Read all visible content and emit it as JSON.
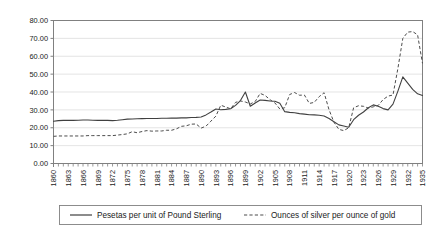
{
  "chart_data": {
    "type": "line",
    "title": "",
    "subtitle": "",
    "xlabel": "",
    "ylabel": "",
    "xlim": [
      1860,
      1935
    ],
    "ylim": [
      0,
      80
    ],
    "grid": true,
    "legend_position": "bottom",
    "y_ticks": [
      "0.00",
      "10.00",
      "20.00",
      "30.00",
      "40.00",
      "50.00",
      "60.00",
      "70.00",
      "80.00"
    ],
    "y_tick_values": [
      0,
      10,
      20,
      30,
      40,
      50,
      60,
      70,
      80
    ],
    "x_tick_labels": [
      "1860",
      "1863",
      "1866",
      "1869",
      "1872",
      "1875",
      "1878",
      "1881",
      "1884",
      "1887",
      "1890",
      "1893",
      "1896",
      "1899",
      "1902",
      "1905",
      "1908",
      "1911",
      "1914",
      "1917",
      "1920",
      "1923",
      "1926",
      "1929",
      "1932",
      "1935"
    ],
    "x_tick_values": [
      1860,
      1863,
      1866,
      1869,
      1872,
      1875,
      1878,
      1881,
      1884,
      1887,
      1890,
      1893,
      1896,
      1899,
      1902,
      1905,
      1908,
      1911,
      1914,
      1917,
      1920,
      1923,
      1926,
      1929,
      1932,
      1935
    ],
    "x": [
      1860,
      1861,
      1862,
      1863,
      1864,
      1865,
      1866,
      1867,
      1868,
      1869,
      1870,
      1871,
      1872,
      1873,
      1874,
      1875,
      1876,
      1877,
      1878,
      1879,
      1880,
      1881,
      1882,
      1883,
      1884,
      1885,
      1886,
      1887,
      1888,
      1889,
      1890,
      1891,
      1892,
      1893,
      1894,
      1895,
      1896,
      1897,
      1898,
      1899,
      1900,
      1901,
      1902,
      1903,
      1904,
      1905,
      1906,
      1907,
      1908,
      1909,
      1910,
      1911,
      1912,
      1913,
      1914,
      1915,
      1916,
      1917,
      1918,
      1919,
      1920,
      1921,
      1922,
      1923,
      1924,
      1925,
      1926,
      1927,
      1928,
      1929,
      1930,
      1931,
      1932,
      1933,
      1934,
      1935
    ],
    "series": [
      {
        "name": "Pesetas per unit of Pound Sterling",
        "style": "solid",
        "color": "#404040",
        "values": [
          23.6,
          24.0,
          24.1,
          24.1,
          24.1,
          24.2,
          24.3,
          24.3,
          24.2,
          24.1,
          24.2,
          24.1,
          24.0,
          24.2,
          24.5,
          24.8,
          24.9,
          25.0,
          25.1,
          25.2,
          25.2,
          25.2,
          25.3,
          25.3,
          25.4,
          25.4,
          25.5,
          25.5,
          25.7,
          25.8,
          26.0,
          27.2,
          28.8,
          30.5,
          30.1,
          30.3,
          30.6,
          32.5,
          35.2,
          40.0,
          32.0,
          33.8,
          35.5,
          35.3,
          35.0,
          34.8,
          33.7,
          29.0,
          28.6,
          28.4,
          27.9,
          27.6,
          27.3,
          27.2,
          27.0,
          26.6,
          25.2,
          23.4,
          21.6,
          21.0,
          20.3,
          24.5,
          27.0,
          28.8,
          31.2,
          32.8,
          32.0,
          30.7,
          30.0,
          33.2,
          40.5,
          48.5,
          45.0,
          41.5,
          39.0,
          38.0
        ]
      },
      {
        "name": "Ounces of silver per ounce of gold",
        "style": "dashed",
        "color": "#4d4d4d",
        "values": [
          15.2,
          15.4,
          15.4,
          15.4,
          15.4,
          15.4,
          15.4,
          15.6,
          15.6,
          15.6,
          15.6,
          15.6,
          15.6,
          15.9,
          16.2,
          16.6,
          17.8,
          17.2,
          17.9,
          18.4,
          18.1,
          18.2,
          18.2,
          18.6,
          18.6,
          19.4,
          20.8,
          21.1,
          22.0,
          22.1,
          19.8,
          20.9,
          23.7,
          26.5,
          32.6,
          31.6,
          30.6,
          34.2,
          35.0,
          34.4,
          33.3,
          34.7,
          39.2,
          38.1,
          35.7,
          33.9,
          30.5,
          31.2,
          38.6,
          39.7,
          38.2,
          38.3,
          33.6,
          34.2,
          37.4,
          39.6,
          30.1,
          23.1,
          19.1,
          18.4,
          20.0,
          31.2,
          32.3,
          32.0,
          31.0,
          31.7,
          32.5,
          35.8,
          37.7,
          38.3,
          53.2,
          70.0,
          73.5,
          73.8,
          72.0,
          56.0
        ]
      }
    ],
    "legend": [
      {
        "label": "Pesetas per unit of Pound Sterling",
        "style": "solid"
      },
      {
        "label": "Ounces of silver per ounce of gold",
        "style": "dashed"
      }
    ],
    "colors": {
      "grid": "#d9d9d9",
      "axis": "#808080",
      "series_solid": "#404040",
      "series_dashed": "#4d4d4d",
      "background": "#ffffff"
    }
  }
}
